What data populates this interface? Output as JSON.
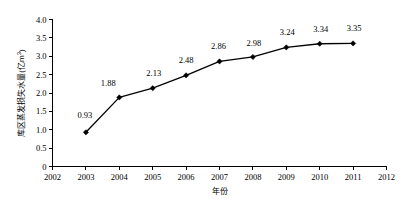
{
  "chart_data": {
    "type": "line",
    "title": "",
    "xlabel": "年份",
    "ylabel": "库区蒸发损失水量(亿m³)",
    "ylabel_base": "库区蒸发损失水量(亿m",
    "ylabel_sup": "3",
    "ylabel_close": ")",
    "x": [
      2003,
      2004,
      2005,
      2006,
      2007,
      2008,
      2009,
      2010,
      2011
    ],
    "values": [
      0.93,
      1.88,
      2.13,
      2.48,
      2.86,
      2.98,
      3.24,
      3.34,
      3.35
    ],
    "point_labels": [
      "0.93",
      "1.88",
      "2.13",
      "2.48",
      "2.86",
      "2.98",
      "3.24",
      "3.34",
      "3.35"
    ],
    "xlim": [
      2002,
      2012
    ],
    "ylim": [
      0,
      4.0
    ],
    "x_tick_labels": [
      "2002",
      "2003",
      "2004",
      "2005",
      "2006",
      "2007",
      "2008",
      "2009",
      "2010",
      "2011",
      "2012"
    ],
    "x_tick_values": [
      2002,
      2003,
      2004,
      2005,
      2006,
      2007,
      2008,
      2009,
      2010,
      2011,
      2012
    ],
    "y_tick_labels": [
      "0",
      "0.5",
      "1.0",
      "1.5",
      "2.0",
      "2.5",
      "3.0",
      "3.5",
      "4.0"
    ],
    "y_tick_values": [
      0,
      0.5,
      1.0,
      1.5,
      2.0,
      2.5,
      3.0,
      3.5,
      4.0
    ],
    "grid": false,
    "legend": false,
    "series_color": "#000000",
    "marker_shape": "diamond",
    "background_color": "#ffffff"
  }
}
